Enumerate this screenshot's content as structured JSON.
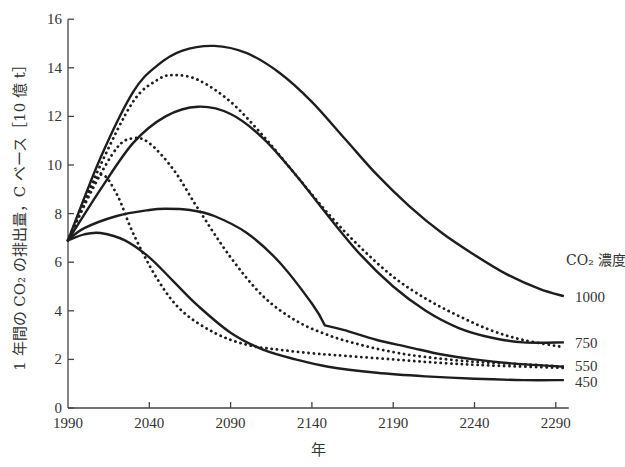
{
  "chart_data": {
    "type": "line",
    "title": "",
    "xlabel": "年",
    "ylabel": "1 年間の CO₂ の排出量，C ベース［10 億 t］",
    "xlim": [
      1990,
      2298
    ],
    "ylim": [
      0,
      16
    ],
    "xticks": [
      1990,
      2040,
      2090,
      2140,
      2190,
      2240,
      2290
    ],
    "yticks": [
      0,
      2,
      4,
      6,
      8,
      10,
      12,
      14,
      16
    ],
    "grid": false,
    "legend": {
      "title": "CO₂ 濃度",
      "position": "right, inline at curve ends",
      "entries": [
        "1000",
        "750",
        "550",
        "450"
      ]
    },
    "series": [
      {
        "name": "1000 (solid)",
        "style": "solid",
        "label": "1000",
        "x": [
          1990,
          2010,
          2030,
          2045,
          2060,
          2080,
          2100,
          2120,
          2140,
          2160,
          2180,
          2200,
          2220,
          2240,
          2260,
          2280,
          2295
        ],
        "values": [
          6.9,
          10.3,
          13.0,
          14.1,
          14.7,
          14.9,
          14.6,
          13.8,
          12.6,
          11.1,
          9.6,
          8.3,
          7.2,
          6.3,
          5.5,
          4.9,
          4.6
        ]
      },
      {
        "name": "1000 (dotted)",
        "style": "dotted",
        "label": "1000",
        "x": [
          1990,
          2010,
          2030,
          2045,
          2055,
          2070,
          2090,
          2110,
          2130,
          2150,
          2170,
          2190,
          2210,
          2230,
          2250,
          2270,
          2295
        ],
        "values": [
          6.9,
          10.0,
          12.6,
          13.5,
          13.7,
          13.5,
          12.6,
          11.2,
          9.6,
          8.0,
          6.6,
          5.4,
          4.5,
          3.8,
          3.2,
          2.8,
          2.5
        ]
      },
      {
        "name": "750 (solid)",
        "style": "solid",
        "label": "750",
        "x": [
          1990,
          2010,
          2030,
          2050,
          2070,
          2090,
          2110,
          2130,
          2150,
          2170,
          2190,
          2210,
          2230,
          2250,
          2270,
          2295
        ],
        "values": [
          6.9,
          9.0,
          10.9,
          12.0,
          12.4,
          12.1,
          11.1,
          9.6,
          7.9,
          6.3,
          5.0,
          4.0,
          3.3,
          2.9,
          2.7,
          2.7
        ]
      },
      {
        "name": "750 (dotted)",
        "style": "dotted",
        "label": "750",
        "x": [
          1990,
          2005,
          2020,
          2030,
          2040,
          2055,
          2070,
          2090,
          2110,
          2130,
          2150,
          2170,
          2190,
          2210,
          2240,
          2270,
          2295
        ],
        "values": [
          6.9,
          9.0,
          10.7,
          11.1,
          10.9,
          9.8,
          8.2,
          6.2,
          4.6,
          3.6,
          3.0,
          2.6,
          2.3,
          2.1,
          1.9,
          1.8,
          1.7
        ]
      },
      {
        "name": "550 (solid)",
        "style": "solid",
        "label": "550",
        "x": [
          1990,
          2000,
          2020,
          2040,
          2050,
          2065,
          2080,
          2100,
          2120,
          2140,
          2148,
          2160,
          2180,
          2200,
          2220,
          2240,
          2260,
          2295
        ],
        "values": [
          6.9,
          7.4,
          7.9,
          8.15,
          8.2,
          8.15,
          7.9,
          7.2,
          6.0,
          4.3,
          3.4,
          3.2,
          2.8,
          2.5,
          2.2,
          2.0,
          1.85,
          1.7
        ]
      },
      {
        "name": "550 (dotted)",
        "style": "dotted",
        "label": "550",
        "x": [
          1990,
          2000,
          2010,
          2020,
          2030,
          2045,
          2060,
          2080,
          2100,
          2120,
          2140,
          2160,
          2190,
          2220,
          2250,
          2295
        ],
        "values": [
          6.9,
          8.4,
          9.6,
          8.8,
          7.2,
          5.3,
          4.0,
          3.1,
          2.6,
          2.4,
          2.25,
          2.15,
          2.0,
          1.85,
          1.75,
          1.65
        ]
      },
      {
        "name": "450 (solid)",
        "style": "solid",
        "label": "450",
        "x": [
          1990,
          2000,
          2010,
          2025,
          2040,
          2055,
          2070,
          2090,
          2110,
          2130,
          2150,
          2180,
          2210,
          2240,
          2270,
          2295
        ],
        "values": [
          6.9,
          7.15,
          7.2,
          6.9,
          6.2,
          5.2,
          4.2,
          3.1,
          2.4,
          2.0,
          1.7,
          1.45,
          1.3,
          1.2,
          1.15,
          1.15
        ]
      }
    ]
  },
  "layout": {
    "plot": {
      "x0": 68,
      "y0": 408,
      "px_per_year": 1.626,
      "px_per_unit": 24.3
    },
    "legend_labels_y": {
      "1000": 296,
      "750": 342,
      "550": 365,
      "450": 381
    }
  }
}
